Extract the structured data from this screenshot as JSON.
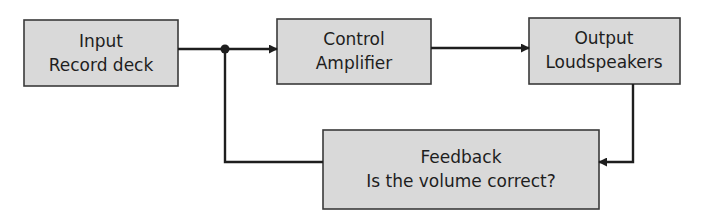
{
  "diagram": {
    "type": "block-diagram",
    "nodes": [
      {
        "id": "input",
        "lines": [
          "Input",
          "Record deck"
        ]
      },
      {
        "id": "control",
        "lines": [
          "Control",
          "Amplifier"
        ]
      },
      {
        "id": "output",
        "lines": [
          "Output",
          "Loudspeakers"
        ]
      },
      {
        "id": "feedback",
        "lines": [
          "Feedback",
          "Is the volume correct?"
        ]
      }
    ],
    "edges": [
      {
        "from": "input",
        "to": "control",
        "via": "junction"
      },
      {
        "from": "control",
        "to": "output"
      },
      {
        "from": "output",
        "to": "feedback"
      },
      {
        "from": "feedback",
        "to": "control",
        "via": "junction"
      }
    ],
    "colors": {
      "box_fill": "#d9d9d9",
      "box_stroke": "#3a3a3a",
      "line": "#1e1e1e",
      "text": "#1e1e1e"
    }
  }
}
